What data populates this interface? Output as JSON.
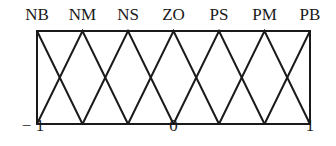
{
  "diagram": {
    "sets": [
      {
        "label": "NB",
        "peak": -1.0
      },
      {
        "label": "NM",
        "peak": -0.6667
      },
      {
        "label": "NS",
        "peak": -0.3333
      },
      {
        "label": "ZO",
        "peak": 0.0
      },
      {
        "label": "PS",
        "peak": 0.3333
      },
      {
        "label": "PM",
        "peak": 0.6667
      },
      {
        "label": "PB",
        "peak": 1.0
      }
    ],
    "axis_ticks": [
      {
        "label": "− 1",
        "value": -1
      },
      {
        "label": "0",
        "value": 0
      },
      {
        "label": "1",
        "value": 1
      }
    ],
    "stroke_color": "#1a1a1a"
  }
}
